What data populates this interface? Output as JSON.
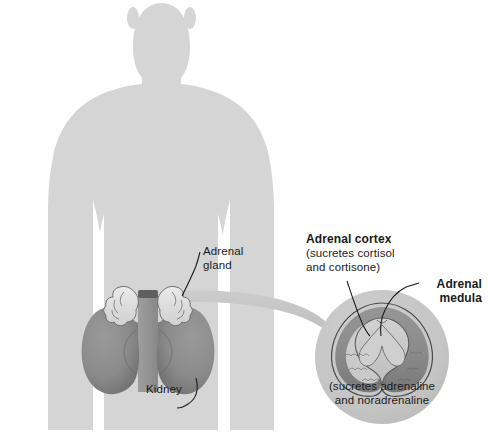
{
  "figure": {
    "background_color": "#ffffff",
    "body_color": "#d5d5d5",
    "body_shadow_color": "#c9c9c9",
    "kidney_color": "#8e8e8e",
    "kidney_dark_color": "#6f6f6f",
    "adrenal_color": "#e2e2e2",
    "vessel_color": "#8e8e8e",
    "inset_circle_color": "#c6c6c6",
    "inset_cortex_color": "#8e8e8e",
    "inset_medulla_color": "#c9c9c9",
    "connector_color": "#c2c2c2",
    "leader_color": "#1a1a1a",
    "text_color": "#1a1a1a"
  },
  "labels": {
    "adrenal_gland": "Adrenal\ngland",
    "kidney": "Kidney",
    "adrenal_cortex_title": "Adrenal cortex",
    "adrenal_cortex_note": "(sucretes cortisol\nand cortisone)",
    "adrenal_medula_title": "Adrenal\nmedula",
    "medulla_note": "(sucretes adrenaline\nand noradrenaline"
  }
}
